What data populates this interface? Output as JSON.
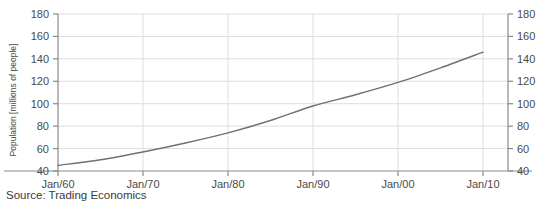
{
  "footer": {
    "source_text": "Source: Trading Economics"
  },
  "chart_data": {
    "type": "line",
    "title": "",
    "xlabel": "",
    "ylabel": "Population [millions of people]",
    "ylim": [
      40,
      180
    ],
    "yticks": [
      40,
      60,
      80,
      100,
      120,
      140,
      160,
      180
    ],
    "ytick_labels_left": [
      "40",
      "60",
      "80",
      "100",
      "120",
      "140",
      "160",
      "180"
    ],
    "ytick_labels_right": [
      "40",
      "60",
      "80",
      "100",
      "120",
      "140",
      "160",
      "180"
    ],
    "grid": true,
    "grid_axis": "both",
    "legend": "none",
    "xtick_labels": [
      "Jan/60",
      "Jan/70",
      "Jan/80",
      "Jan/90",
      "Jan/00",
      "Jan/10"
    ],
    "x": [
      1960,
      1965,
      1970,
      1975,
      1980,
      1985,
      1990,
      1995,
      2000,
      2005,
      2010,
      2015
    ],
    "series": [
      {
        "name": "Population",
        "values": [
          45,
          50,
          57,
          65,
          74,
          85,
          98,
          108,
          119,
          132,
          146,
          160
        ]
      }
    ],
    "axis_color": "#8a8a8a",
    "grid_color": "#dedede",
    "line_color": "#707070",
    "text_color": "#3a3a3a"
  }
}
